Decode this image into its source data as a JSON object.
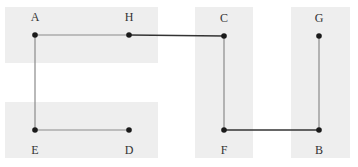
{
  "diagram": {
    "type": "graph",
    "width": 358,
    "height": 167,
    "colors": {
      "background": "#ffffff",
      "region": "#eeeeee",
      "edge_light": "#8a8a8a",
      "edge_dark": "#333333",
      "node": "#1a1a1a",
      "label": "#333333"
    },
    "regions": [
      {
        "id": "top-left",
        "x": 5,
        "y": 7,
        "w": 153,
        "h": 56
      },
      {
        "id": "bottom-left",
        "x": 5,
        "y": 102,
        "w": 153,
        "h": 56
      },
      {
        "id": "middle-column",
        "x": 195,
        "y": 7,
        "w": 58,
        "h": 151
      },
      {
        "id": "right-column",
        "x": 291,
        "y": 7,
        "w": 59,
        "h": 151
      }
    ],
    "nodes": [
      {
        "id": "A",
        "label": "A",
        "x": 35,
        "y": 35,
        "label_pos": "above"
      },
      {
        "id": "H",
        "label": "H",
        "x": 129,
        "y": 35,
        "label_pos": "above"
      },
      {
        "id": "C",
        "label": "C",
        "x": 224,
        "y": 36,
        "label_pos": "above"
      },
      {
        "id": "G",
        "label": "G",
        "x": 319,
        "y": 36,
        "label_pos": "above"
      },
      {
        "id": "E",
        "label": "E",
        "x": 35,
        "y": 130,
        "label_pos": "below"
      },
      {
        "id": "D",
        "label": "D",
        "x": 129,
        "y": 130,
        "label_pos": "below"
      },
      {
        "id": "F",
        "label": "F",
        "x": 224,
        "y": 130,
        "label_pos": "below"
      },
      {
        "id": "B",
        "label": "B",
        "x": 319,
        "y": 130,
        "label_pos": "below"
      }
    ],
    "edges": [
      {
        "from": "A",
        "to": "H",
        "style": "light"
      },
      {
        "from": "H",
        "to": "C",
        "style": "dark"
      },
      {
        "from": "A",
        "to": "E",
        "style": "light"
      },
      {
        "from": "E",
        "to": "D",
        "style": "light"
      },
      {
        "from": "C",
        "to": "F",
        "style": "light"
      },
      {
        "from": "F",
        "to": "B",
        "style": "dark"
      },
      {
        "from": "G",
        "to": "B",
        "style": "light"
      }
    ]
  }
}
